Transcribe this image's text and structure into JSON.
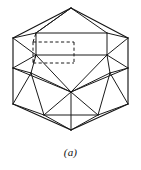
{
  "figure": {
    "caption": "(a)",
    "line_color": "#1a1a1a",
    "background_color": "#ffffff",
    "width": 141,
    "height": 170
  },
  "geometry": {
    "vertices": {
      "top_apex": [
        71,
        8
      ],
      "upper_left": [
        13,
        38
      ],
      "upper_right": [
        128,
        38
      ],
      "left_mid": [
        13,
        68
      ],
      "right_mid": [
        128,
        68
      ],
      "lower_left": [
        13,
        104
      ],
      "lower_right": [
        128,
        104
      ],
      "bottom_apex": [
        71,
        130
      ],
      "rect_tl": [
        36,
        33
      ],
      "rect_tr": [
        107,
        33
      ],
      "rect_br": [
        107,
        55
      ],
      "rect_bl": [
        36,
        55
      ],
      "hub": [
        71,
        92
      ],
      "inner_left": [
        31,
        73
      ],
      "inner_right": [
        110,
        73
      ],
      "band_left": [
        44,
        115
      ],
      "band_right": [
        98,
        115
      ],
      "hid_tl": [
        33,
        42
      ],
      "hid_tr": [
        74,
        42
      ],
      "hid_br": [
        74,
        63
      ],
      "hid_bl": [
        33,
        63
      ]
    },
    "solid_edges": [
      [
        "top_apex",
        "upper_left"
      ],
      [
        "top_apex",
        "upper_right"
      ],
      [
        "top_apex",
        "rect_tl"
      ],
      [
        "top_apex",
        "rect_tr"
      ],
      [
        "upper_left",
        "left_mid"
      ],
      [
        "upper_right",
        "right_mid"
      ],
      [
        "left_mid",
        "lower_left"
      ],
      [
        "right_mid",
        "lower_right"
      ],
      [
        "lower_left",
        "bottom_apex"
      ],
      [
        "lower_right",
        "bottom_apex"
      ],
      [
        "rect_tl",
        "rect_tr"
      ],
      [
        "rect_tr",
        "rect_br"
      ],
      [
        "rect_br",
        "rect_bl"
      ],
      [
        "rect_bl",
        "rect_tl"
      ],
      [
        "upper_left",
        "rect_tl"
      ],
      [
        "upper_right",
        "rect_tr"
      ],
      [
        "upper_left",
        "rect_bl"
      ],
      [
        "upper_right",
        "rect_br"
      ],
      [
        "left_mid",
        "rect_bl"
      ],
      [
        "right_mid",
        "rect_br"
      ],
      [
        "left_mid",
        "inner_left"
      ],
      [
        "right_mid",
        "inner_right"
      ],
      [
        "rect_bl",
        "inner_left"
      ],
      [
        "rect_br",
        "inner_right"
      ],
      [
        "inner_left",
        "band_left"
      ],
      [
        "inner_right",
        "band_right"
      ],
      [
        "inner_left",
        "hub"
      ],
      [
        "inner_right",
        "hub"
      ],
      [
        "rect_bl",
        "hub"
      ],
      [
        "rect_br",
        "hub"
      ],
      [
        "hub",
        "band_left"
      ],
      [
        "hub",
        "band_right"
      ],
      [
        "hub",
        "bottom_apex"
      ],
      [
        "lower_left",
        "band_left"
      ],
      [
        "lower_right",
        "band_right"
      ],
      [
        "lower_left",
        "inner_left"
      ],
      [
        "lower_right",
        "inner_right"
      ],
      [
        "band_left",
        "bottom_apex"
      ],
      [
        "band_right",
        "bottom_apex"
      ],
      [
        "band_left",
        "band_right"
      ],
      [
        "top_apex",
        "rect_tl"
      ],
      [
        "left_mid",
        "hub"
      ],
      [
        "right_mid",
        "hub"
      ]
    ],
    "hidden_edges": [
      [
        "hid_tl",
        "hid_tr"
      ],
      [
        "hid_tr",
        "hid_br"
      ],
      [
        "hid_bl",
        "hid_br"
      ],
      [
        "hid_tl",
        "hid_bl"
      ],
      [
        "hid_bl",
        "rect_bl"
      ],
      [
        "hid_tl",
        "rect_tl"
      ]
    ],
    "face_polygons": [
      [
        "rect_tl",
        "rect_tr",
        "rect_br",
        "rect_bl"
      ]
    ]
  }
}
